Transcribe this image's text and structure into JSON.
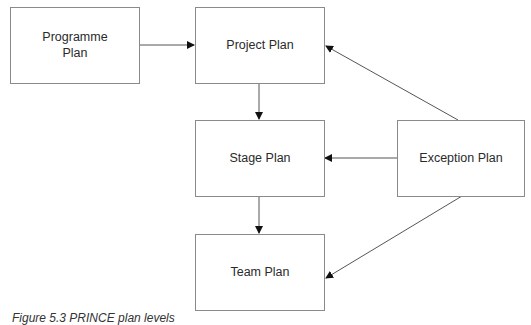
{
  "diagram": {
    "nodes": [
      {
        "id": "programme",
        "label": "Programme\nPlan",
        "line1": "Programme",
        "line2": "Plan"
      },
      {
        "id": "project",
        "label": "Project Plan"
      },
      {
        "id": "stage",
        "label": "Stage Plan"
      },
      {
        "id": "exception",
        "label": "Exception Plan"
      },
      {
        "id": "team",
        "label": "Team Plan"
      }
    ],
    "edges": [
      {
        "from": "programme",
        "to": "project"
      },
      {
        "from": "project",
        "to": "stage"
      },
      {
        "from": "stage",
        "to": "team"
      },
      {
        "from": "exception",
        "to": "project"
      },
      {
        "from": "exception",
        "to": "stage"
      },
      {
        "from": "exception",
        "to": "team"
      }
    ],
    "caption": "Figure 5.3 PRINCE plan levels"
  }
}
